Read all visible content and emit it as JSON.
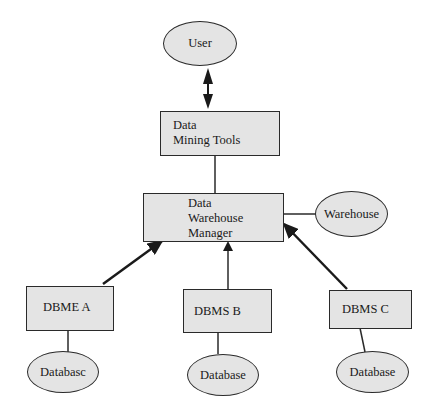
{
  "diagram": {
    "type": "architecture",
    "nodes": {
      "user": {
        "label": "User",
        "shape": "ellipse"
      },
      "mining_tools": {
        "label_line1": "Data",
        "label_line2": "Mining Tools",
        "shape": "rectangle"
      },
      "dw_manager": {
        "label_line1": "Data",
        "label_line2": "Warehouse",
        "label_line3": "Manager",
        "shape": "rectangle"
      },
      "warehouse": {
        "label": "Warehouse",
        "shape": "ellipse"
      },
      "dbms_a": {
        "label": "DBME A",
        "shape": "rectangle"
      },
      "dbms_b": {
        "label": "DBMS B",
        "shape": "rectangle"
      },
      "dbms_c": {
        "label": "DBMS C",
        "shape": "rectangle"
      },
      "db_a": {
        "label": "Databasc",
        "shape": "ellipse"
      },
      "db_b": {
        "label": "Database",
        "shape": "ellipse"
      },
      "db_c": {
        "label": "Database",
        "shape": "ellipse"
      }
    },
    "edges": [
      {
        "from": "user",
        "to": "mining_tools",
        "style": "double-arrow"
      },
      {
        "from": "mining_tools",
        "to": "dw_manager",
        "style": "line"
      },
      {
        "from": "dw_manager",
        "to": "warehouse",
        "style": "line"
      },
      {
        "from": "dbms_a",
        "to": "dw_manager",
        "style": "arrow"
      },
      {
        "from": "dbms_b",
        "to": "dw_manager",
        "style": "arrow"
      },
      {
        "from": "dbms_c",
        "to": "dw_manager",
        "style": "arrow"
      },
      {
        "from": "dbms_a",
        "to": "db_a",
        "style": "line"
      },
      {
        "from": "dbms_b",
        "to": "db_b",
        "style": "line"
      },
      {
        "from": "dbms_c",
        "to": "db_c",
        "style": "line"
      }
    ],
    "colors": {
      "fill": "#e4e4e4",
      "stroke": "#2a2a2a"
    }
  }
}
